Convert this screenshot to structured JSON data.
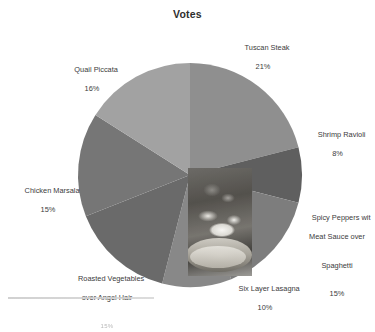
{
  "chart_data": {
    "type": "pie",
    "title": "Votes",
    "xlabel": "",
    "ylabel": "",
    "legend_position": "none",
    "labels_outside": true,
    "grid": false,
    "categories": [
      "Tuscan Steak",
      "Shrimp Ravioli",
      "Spicy Peppers wit Meat Sauce over Spaghetti",
      "Six Layer Lasagna",
      "Roasted Vegetables over Angel Hair",
      "Chicken Marsala",
      "Quail Piccata"
    ],
    "values": [
      21,
      8,
      15,
      10,
      15,
      15,
      16
    ],
    "value_suffix": "%",
    "start_angle_deg": 0,
    "direction": "clockwise",
    "slices": [
      {
        "name": "Tuscan Steak",
        "label_line1": "Tuscan Steak",
        "percent_text": "21%",
        "value": 21,
        "color": "#8f8f8f"
      },
      {
        "name": "Shrimp Ravioli",
        "label_line1": "Shrimp Ravioli",
        "percent_text": "8%",
        "value": 8,
        "color": "#5f5f5f"
      },
      {
        "name": "Spicy Peppers wit Meat Sauce over Spaghetti",
        "label_line1": "Spicy Peppers wit",
        "label_line2": "Meat Sauce over",
        "label_line3": "Spaghetti",
        "percent_text": "15%",
        "value": 15,
        "color": "#7d7d7d"
      },
      {
        "name": "Six Layer Lasagna",
        "label_line1": "Six Layer Lasagna",
        "percent_text": "10%",
        "value": 10,
        "color": "#888888"
      },
      {
        "name": "Roasted Vegetables over Angel Hair",
        "label_line1": "Roasted Vegetables",
        "label_line2": "over Angel Hair",
        "percent_text": "15%",
        "value": 15,
        "color": "#6a6a6a"
      },
      {
        "name": "Chicken Marsala",
        "label_line1": "Chicken Marsala",
        "percent_text": "15%",
        "value": 15,
        "color": "#767676"
      },
      {
        "name": "Quail Piccata",
        "label_line1": "Quail Piccata",
        "percent_text": "16%",
        "value": 16,
        "color": "#a2a2a2"
      }
    ]
  },
  "colors": {
    "background": "#ffffff",
    "text": "#3b3b3b",
    "title": "#2e2e2e",
    "rule": "#c9c9c9"
  }
}
